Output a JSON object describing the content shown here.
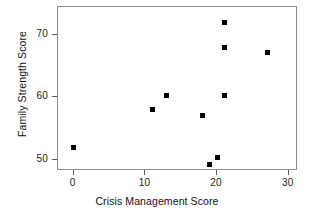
{
  "chart_data": {
    "type": "scatter",
    "title": "",
    "xlabel": "Crisis Management Score",
    "ylabel": "Family Strength Score",
    "xlim": [
      -2.2,
      31.3
    ],
    "ylim": [
      48.2,
      74.4
    ],
    "xticks": [
      0,
      10,
      20,
      30
    ],
    "xticklabels": [
      "0",
      "10",
      "20",
      "30"
    ],
    "yticks": [
      50,
      60,
      70
    ],
    "yticklabels": [
      "50",
      "60",
      "70"
    ],
    "grid": false,
    "legend": null,
    "marker": "square",
    "marker_color": "#000000",
    "points": [
      {
        "x": 0,
        "y": 52.0
      },
      {
        "x": 11,
        "y": 58.0
      },
      {
        "x": 13,
        "y": 60.2
      },
      {
        "x": 18,
        "y": 57.0
      },
      {
        "x": 19,
        "y": 49.3
      },
      {
        "x": 20,
        "y": 50.4
      },
      {
        "x": 21,
        "y": 60.3
      },
      {
        "x": 21,
        "y": 68.0
      },
      {
        "x": 21,
        "y": 72.0
      },
      {
        "x": 27,
        "y": 67.2
      }
    ]
  },
  "figure": {
    "background": "#ffffff",
    "frame_color": "#8d8d8d"
  }
}
